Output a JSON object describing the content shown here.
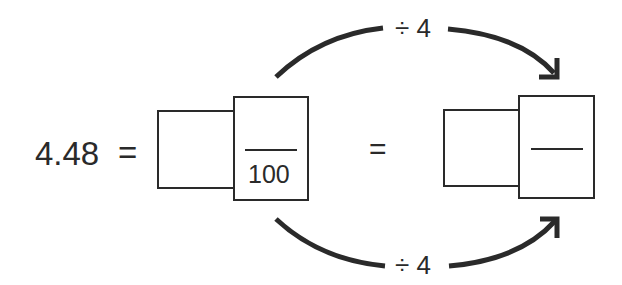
{
  "equation": {
    "decimal": "4.48",
    "equals_1": "=",
    "equals_2": "=",
    "left_fraction": {
      "whole_box": "",
      "numerator_box": "",
      "denominator": "100"
    },
    "right_fraction": {
      "whole_box": "",
      "numerator_box": "",
      "denominator": ""
    }
  },
  "arrows": {
    "top_label": "÷ 4",
    "bottom_label": "÷ 4"
  },
  "colors": {
    "ink": "#2a2a2a",
    "background": "#ffffff"
  }
}
